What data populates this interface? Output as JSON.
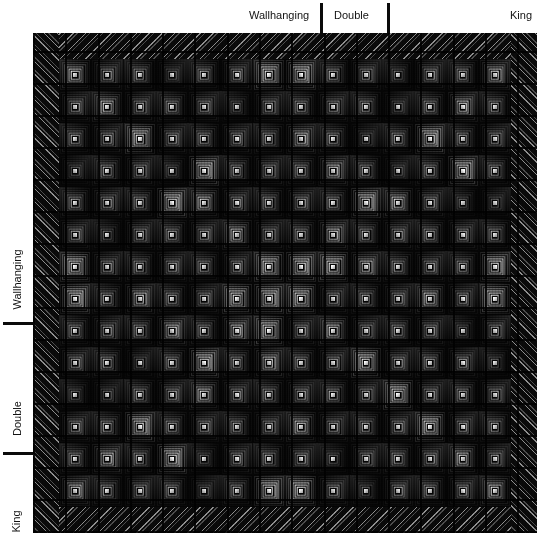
{
  "figure": {
    "type": "quilt-design-preview",
    "background_color": "#ffffff"
  },
  "top_ruler": {
    "name": "horizontal-size-ruler",
    "labels": [
      {
        "text": "Wallhanging",
        "x": 249,
        "y": 10,
        "align": "left"
      },
      {
        "text": "Double",
        "x": 334,
        "y": 10,
        "align": "left"
      },
      {
        "text": "King",
        "x": 510,
        "y": 10,
        "align": "left"
      }
    ],
    "ticks": [
      {
        "x": 320,
        "y": 3,
        "height": 30
      },
      {
        "x": 387,
        "y": 3,
        "height": 30
      }
    ]
  },
  "left_ruler": {
    "name": "vertical-size-ruler",
    "labels": [
      {
        "text": "Wallhanging",
        "x": 10,
        "y": 236
      },
      {
        "text": "Double",
        "x": 10,
        "y": 389
      },
      {
        "text": "King",
        "x": 10,
        "y": 508
      }
    ],
    "ticks": [
      {
        "x": 3,
        "y": 322,
        "width": 30
      },
      {
        "x": 3,
        "y": 452,
        "width": 30
      }
    ]
  },
  "quilt": {
    "name": "quilt-canvas",
    "x": 33,
    "y": 33,
    "width": 504,
    "height": 500,
    "border_width": 26,
    "border_style": "diagonal-stripe",
    "background_color": "#070707",
    "block_style": "log-cabin-concentric-square",
    "grid_columns": 14,
    "grid_rows": 14,
    "core_color": "#e8e8e8",
    "ring_colors": [
      "#1a1a1a",
      "#2e2e2e",
      "#4a4a4a",
      "#6e6e6e",
      "#9a9a9a",
      "#c8c8c8"
    ],
    "accent_cells": [
      [
        5,
        7
      ],
      [
        6,
        6
      ],
      [
        6,
        7
      ],
      [
        7,
        6
      ],
      [
        7,
        7
      ],
      [
        6,
        8
      ],
      [
        8,
        6
      ],
      [
        3,
        4
      ],
      [
        4,
        3
      ],
      [
        10,
        10
      ],
      [
        11,
        11
      ],
      [
        2,
        11
      ],
      [
        3,
        12
      ],
      [
        11,
        2
      ],
      [
        12,
        3
      ],
      [
        0,
        6
      ],
      [
        0,
        7
      ],
      [
        13,
        6
      ],
      [
        13,
        7
      ],
      [
        6,
        0
      ],
      [
        7,
        0
      ],
      [
        6,
        13
      ],
      [
        7,
        13
      ],
      [
        9,
        9
      ],
      [
        4,
        9
      ],
      [
        9,
        4
      ],
      [
        2,
        2
      ],
      [
        11,
        11
      ]
    ],
    "mid_cells": [
      [
        1,
        1
      ],
      [
        1,
        12
      ],
      [
        12,
        1
      ],
      [
        12,
        12
      ],
      [
        4,
        4
      ],
      [
        4,
        10
      ],
      [
        10,
        4
      ],
      [
        10,
        10
      ],
      [
        2,
        7
      ],
      [
        7,
        2
      ],
      [
        7,
        11
      ],
      [
        11,
        7
      ],
      [
        5,
        5
      ],
      [
        8,
        8
      ],
      [
        5,
        8
      ],
      [
        8,
        5
      ],
      [
        0,
        0
      ],
      [
        0,
        13
      ],
      [
        13,
        0
      ],
      [
        13,
        13
      ],
      [
        3,
        8
      ],
      [
        8,
        3
      ],
      [
        9,
        6
      ],
      [
        6,
        9
      ]
    ],
    "dim_cells": [
      [
        1,
        5
      ],
      [
        5,
        1
      ],
      [
        2,
        9
      ],
      [
        9,
        2
      ],
      [
        12,
        8
      ],
      [
        8,
        12
      ],
      [
        4,
        12
      ],
      [
        12,
        4
      ],
      [
        10,
        1
      ],
      [
        1,
        10
      ],
      [
        3,
        3
      ],
      [
        10,
        3
      ],
      [
        13,
        4
      ],
      [
        4,
        13
      ],
      [
        9,
        13
      ],
      [
        13,
        9
      ],
      [
        0,
        3
      ],
      [
        3,
        0
      ],
      [
        0,
        10
      ],
      [
        10,
        0
      ]
    ]
  },
  "chart_data": {
    "type": "heatmap",
    "title": "",
    "xlabel": "",
    "ylabel": "",
    "x_categories": [
      "Wallhanging",
      "Double",
      "King"
    ],
    "y_categories": [
      "Wallhanging",
      "Double",
      "King"
    ],
    "x_boundaries_px": [
      320,
      387
    ],
    "y_boundaries_px": [
      322,
      452
    ],
    "grid": "on",
    "legend": "none",
    "note": "Quilt size reference rulers: cumulative block grid mapped to finished quilt dimensions."
  }
}
